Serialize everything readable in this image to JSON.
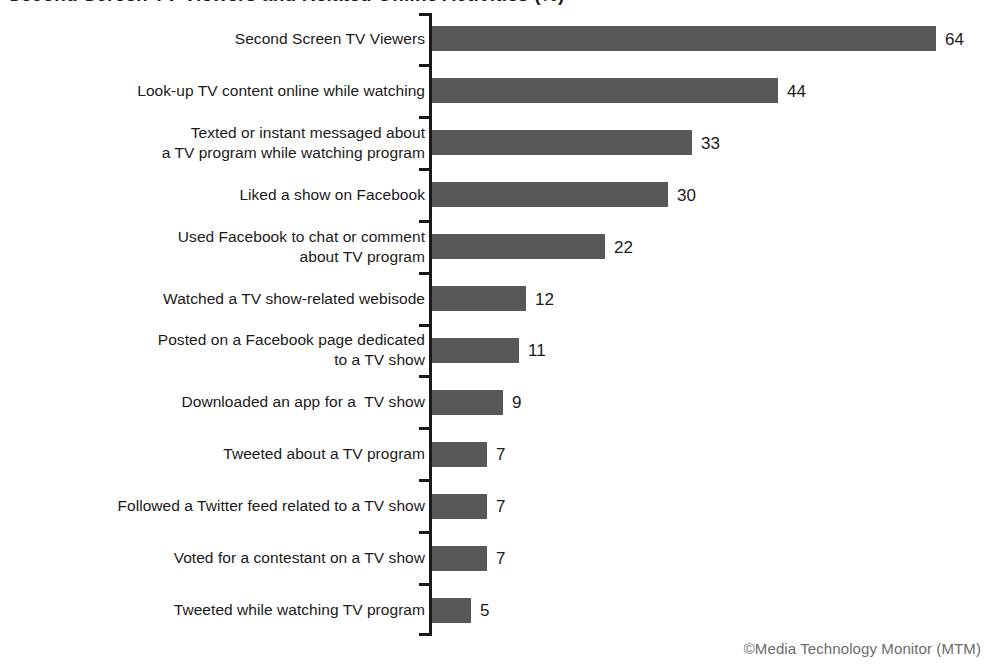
{
  "chart_data": {
    "type": "bar",
    "orientation": "horizontal",
    "title": "Second Screen TV Viewers and Related Online Activities (%)",
    "subtitle": "",
    "xlabel": "",
    "ylabel": "",
    "xlim": [
      0,
      70
    ],
    "grid": false,
    "legend": null,
    "bar_color": "#585858",
    "background_color": "#ffffff",
    "value_suffix": "",
    "credit": "©Media Technology Monitor (MTM)",
    "categories": [
      "Second Screen TV Viewers",
      "Look-up TV content online while watching",
      "Texted or instant messaged about\na TV program while watching program",
      "Liked a show on Facebook",
      "Used Facebook to chat or comment\nabout TV program",
      "Watched a TV show-related webisode",
      "Posted on a Facebook page dedicated\nto a TV show",
      "Downloaded an app for a  TV show",
      "Tweeted about a TV program",
      "Followed a Twitter feed related to a TV show",
      "Voted for a contestant on a TV show",
      "Tweeted while watching TV program"
    ],
    "values": [
      64,
      44,
      33,
      30,
      22,
      12,
      11,
      9,
      7,
      7,
      7,
      5
    ],
    "value_labels": [
      "64",
      "44",
      "33",
      "30",
      "22",
      "12",
      "11",
      "9",
      "7",
      "7",
      "7",
      "5"
    ]
  }
}
